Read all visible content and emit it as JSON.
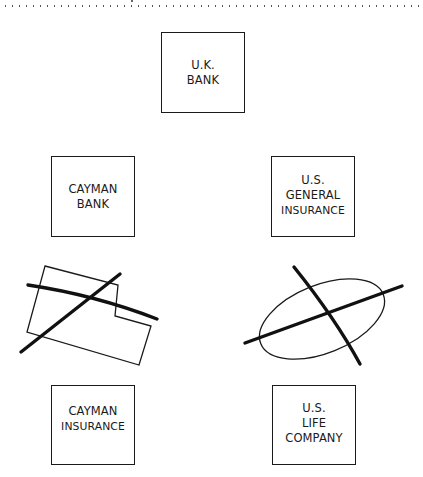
{
  "diagram": {
    "entities": [
      {
        "id": "uk-bank",
        "lines": [
          "U.K.",
          "BANK"
        ],
        "box": {
          "x": 161,
          "y": 32,
          "w": 84,
          "h": 81
        }
      },
      {
        "id": "cayman-bank",
        "lines": [
          "CAYMAN",
          "BANK"
        ],
        "box": {
          "x": 51,
          "y": 156,
          "w": 84,
          "h": 81
        }
      },
      {
        "id": "us-general-insurance",
        "lines": [
          "U.S.",
          "GENERAL",
          "INSURANCE"
        ],
        "box": {
          "x": 271,
          "y": 156,
          "w": 84,
          "h": 81
        }
      },
      {
        "id": "cayman-insurance",
        "lines": [
          "CAYMAN",
          "INSURANCE"
        ],
        "box": {
          "x": 51,
          "y": 385,
          "w": 84,
          "h": 80
        }
      },
      {
        "id": "us-life-company",
        "lines": [
          "U.S.",
          "LIFE",
          "COMPANY"
        ],
        "box": {
          "x": 272,
          "y": 385,
          "w": 84,
          "h": 80
        }
      }
    ],
    "crossed_out_shapes": [
      {
        "id": "crossed-out-irregular-polygon",
        "shape": "polygon",
        "crossed": true
      },
      {
        "id": "crossed-out-ellipse",
        "shape": "ellipse",
        "crossed": true
      }
    ],
    "colors": {
      "stroke": "#1a1a1a",
      "background": "#ffffff",
      "dots": "#555555"
    }
  }
}
